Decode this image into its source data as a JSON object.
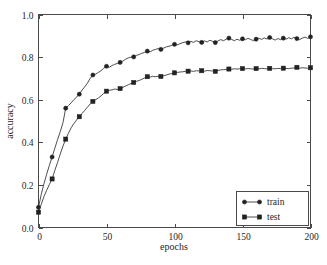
{
  "chart_data": {
    "type": "line",
    "title": "",
    "xlabel": "epochs",
    "ylabel": "accuracy",
    "xlim": [
      0,
      200
    ],
    "ylim": [
      0.0,
      1.0
    ],
    "xticks": [
      0,
      50,
      100,
      150,
      200
    ],
    "yticks": [
      0.0,
      0.2,
      0.4,
      0.6,
      0.8,
      1.0
    ],
    "xtick_labels": [
      "0",
      "50",
      "100",
      "150",
      "200"
    ],
    "ytick_labels": [
      "0.0",
      "0.2",
      "0.4",
      "0.6",
      "0.8",
      "1.0"
    ],
    "grid": false,
    "legend_position": "lower right",
    "marker_interval": 10,
    "line_color": "#3a3a3a",
    "marker_color": "#222222",
    "frame_color": "#4a4a4a",
    "background": "#ffffff",
    "x": [
      0,
      2,
      4,
      6,
      8,
      10,
      12,
      14,
      16,
      18,
      20,
      22,
      24,
      26,
      28,
      30,
      32,
      34,
      36,
      38,
      40,
      42,
      44,
      46,
      48,
      50,
      52,
      54,
      56,
      58,
      60,
      62,
      64,
      66,
      68,
      70,
      72,
      74,
      76,
      78,
      80,
      82,
      84,
      86,
      88,
      90,
      92,
      94,
      96,
      98,
      100,
      102,
      104,
      106,
      108,
      110,
      112,
      114,
      116,
      118,
      120,
      122,
      124,
      126,
      128,
      130,
      132,
      134,
      136,
      138,
      140,
      142,
      144,
      146,
      148,
      150,
      152,
      154,
      156,
      158,
      160,
      162,
      164,
      166,
      168,
      170,
      172,
      174,
      176,
      178,
      180,
      182,
      184,
      186,
      188,
      190,
      192,
      194,
      196,
      198,
      200
    ],
    "series": [
      {
        "name": "train",
        "marker": "circle",
        "values": [
          0.095,
          0.155,
          0.205,
          0.25,
          0.292,
          0.331,
          0.372,
          0.412,
          0.45,
          0.492,
          0.56,
          0.572,
          0.585,
          0.6,
          0.612,
          0.626,
          0.645,
          0.66,
          0.678,
          0.7,
          0.716,
          0.72,
          0.728,
          0.736,
          0.748,
          0.757,
          0.752,
          0.76,
          0.766,
          0.77,
          0.775,
          0.781,
          0.79,
          0.796,
          0.8,
          0.801,
          0.808,
          0.812,
          0.818,
          0.822,
          0.828,
          0.824,
          0.832,
          0.836,
          0.84,
          0.836,
          0.842,
          0.848,
          0.851,
          0.855,
          0.86,
          0.857,
          0.863,
          0.868,
          0.871,
          0.867,
          0.874,
          0.869,
          0.877,
          0.872,
          0.869,
          0.876,
          0.871,
          0.879,
          0.874,
          0.868,
          0.876,
          0.882,
          0.877,
          0.884,
          0.889,
          0.883,
          0.877,
          0.884,
          0.879,
          0.886,
          0.881,
          0.888,
          0.883,
          0.877,
          0.884,
          0.889,
          0.883,
          0.89,
          0.885,
          0.892,
          0.886,
          0.88,
          0.887,
          0.882,
          0.889,
          0.884,
          0.891,
          0.886,
          0.893,
          0.887,
          0.882,
          0.889,
          0.894,
          0.888,
          0.895
        ]
      },
      {
        "name": "test",
        "marker": "square",
        "values": [
          0.072,
          0.108,
          0.145,
          0.175,
          0.202,
          0.228,
          0.268,
          0.305,
          0.345,
          0.382,
          0.415,
          0.442,
          0.468,
          0.488,
          0.505,
          0.52,
          0.535,
          0.55,
          0.565,
          0.58,
          0.592,
          0.6,
          0.608,
          0.618,
          0.63,
          0.64,
          0.644,
          0.646,
          0.65,
          0.648,
          0.652,
          0.658,
          0.664,
          0.67,
          0.676,
          0.681,
          0.686,
          0.69,
          0.696,
          0.702,
          0.708,
          0.706,
          0.71,
          0.708,
          0.71,
          0.709,
          0.712,
          0.716,
          0.72,
          0.723,
          0.726,
          0.728,
          0.73,
          0.731,
          0.733,
          0.734,
          0.735,
          0.733,
          0.736,
          0.735,
          0.736,
          0.734,
          0.737,
          0.736,
          0.735,
          0.733,
          0.737,
          0.74,
          0.741,
          0.742,
          0.744,
          0.743,
          0.745,
          0.744,
          0.745,
          0.746,
          0.745,
          0.746,
          0.745,
          0.744,
          0.746,
          0.745,
          0.747,
          0.746,
          0.745,
          0.747,
          0.746,
          0.745,
          0.747,
          0.746,
          0.748,
          0.747,
          0.746,
          0.748,
          0.749,
          0.752,
          0.748,
          0.75,
          0.749,
          0.748,
          0.75
        ]
      }
    ]
  },
  "legend": {
    "items": [
      {
        "label": "train",
        "marker": "circle"
      },
      {
        "label": "test",
        "marker": "square"
      }
    ]
  }
}
